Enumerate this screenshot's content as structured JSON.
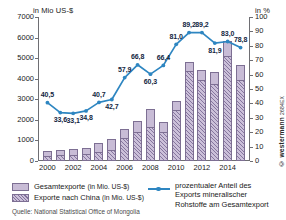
{
  "axes": {
    "left_title": "in Mio US-$",
    "right_title": "in %",
    "left_ticks": [
      "0",
      "1000",
      "2000",
      "3000",
      "4000",
      "5000",
      "6000",
      "7000"
    ],
    "right_ticks": [
      "0",
      "10",
      "20",
      "30",
      "40",
      "50",
      "60",
      "70",
      "80",
      "90",
      "100"
    ],
    "x_ticks": [
      "2000",
      "2002",
      "2004",
      "2006",
      "2008",
      "2010",
      "2012",
      "2014"
    ]
  },
  "legend": {
    "total_label": "Gesamtexporte",
    "total_unit": "(in Mio. US-$)",
    "china_label": "Exporte nach China",
    "china_unit": "(in Mio. US-$)",
    "line_label_1": "prozentualer Anteil des",
    "line_label_2": "Exports mineralischer",
    "line_label_3": "Rohstoffe am Gesamtexport"
  },
  "source": "Quelle: National Statistical Office of Mongolia",
  "watermark": "© westermann",
  "watermark_code": "2684EX",
  "colors": {
    "line": "#2e86c1",
    "bar_total": "#c8bcd6",
    "bar_china_hatch": "#7a6994",
    "axis": "#6e6e73"
  },
  "chart_data": {
    "type": "bar",
    "title": "",
    "subtitle": "",
    "xlabel": "",
    "ylabel": "in Mio US-$",
    "y2label": "in %",
    "ylim": [
      0,
      7000
    ],
    "y2lim": [
      0,
      100
    ],
    "grid": false,
    "legend_position": "bottom",
    "categories": [
      "2000",
      "2001",
      "2002",
      "2003",
      "2004",
      "2005",
      "2006",
      "2007",
      "2008",
      "2009",
      "2010",
      "2011",
      "2012",
      "2013",
      "2014",
      "2015"
    ],
    "series": [
      {
        "name": "Gesamtexporte (in Mio. US-$)",
        "type": "bar",
        "unit": "Mio. US-$",
        "axis": "left",
        "values": [
          466,
          521,
          568,
          627,
          872,
          1070,
          1545,
          1950,
          2540,
          1900,
          2930,
          4820,
          4420,
          4330,
          5830,
          4670
        ]
      },
      {
        "name": "Exporte nach China (in Mio. US-$)",
        "type": "bar",
        "unit": "Mio. US-$",
        "axis": "left",
        "values": [
          260,
          290,
          310,
          330,
          420,
          545,
          1095,
          1390,
          1670,
          1420,
          2470,
          4370,
          3960,
          3720,
          5110,
          3960
        ]
      },
      {
        "name": "prozentualer Anteil des Exports mineralischer Rohstoffe am Gesamtexport",
        "type": "line",
        "unit": "%",
        "axis": "right",
        "values": [
          40.5,
          33.6,
          33.1,
          34.8,
          40.7,
          42.7,
          57.9,
          66.8,
          60.3,
          66.4,
          81.0,
          89.2,
          89.2,
          81.9,
          83.0,
          78.8
        ],
        "labels": [
          "40,5",
          "33,6",
          "33,1",
          "34,8",
          "40,7",
          "42,7",
          "57,9",
          "66,8",
          "60,3",
          "66,4",
          "81,0",
          "89,2",
          "89,2",
          "81,9",
          "83,0",
          "78,8"
        ]
      }
    ]
  }
}
